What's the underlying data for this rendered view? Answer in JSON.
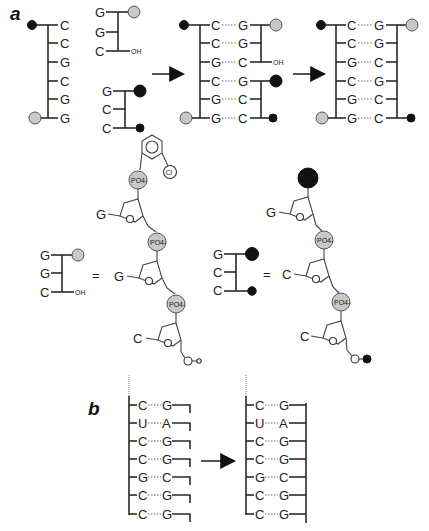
{
  "figure": {
    "panel_a_label": "a",
    "panel_b_label": "b",
    "panel_a": {
      "template_strand": {
        "bases": [
          "C",
          "C",
          "G",
          "C",
          "G",
          "G"
        ],
        "five_prime_mark": "black-dot",
        "three_prime_mark": "grey-circle"
      },
      "probe_1": {
        "bases": [
          "G",
          "G",
          "C"
        ],
        "top_mark": "grey-circle",
        "end_label": "OH"
      },
      "probe_2": {
        "bases": [
          "G",
          "C",
          "C"
        ],
        "top_mark": "black-circle-large",
        "bottom_mark": "black-dot"
      },
      "hybrid": {
        "left": [
          "C",
          "C",
          "G",
          "C",
          "G",
          "G"
        ],
        "right": [
          "G",
          "G",
          "C",
          "G",
          "C",
          "C"
        ],
        "oh_label": "OH"
      },
      "ligated": {
        "left": [
          "C",
          "C",
          "G",
          "C",
          "G",
          "G"
        ],
        "right": [
          "G",
          "G",
          "C",
          "G",
          "C",
          "C"
        ]
      },
      "legend_1": {
        "bases": [
          "G",
          "G",
          "C"
        ],
        "end_label": "OH",
        "equals": "=",
        "nucleotides": [
          "G",
          "C"
        ],
        "phosphate_label": "PO4-",
        "chloro_label": "Cl"
      },
      "legend_2": {
        "bases": [
          "G",
          "C",
          "C"
        ],
        "equals": "=",
        "nucleotides": [
          "G",
          "C",
          "C"
        ],
        "phosphate_label": "PO4-"
      }
    },
    "panel_b": {
      "before": {
        "left": [
          "C",
          "U",
          "C",
          "C",
          "G",
          "C",
          "C"
        ],
        "right": [
          "G",
          "A",
          "G",
          "G",
          "C",
          "G",
          "G"
        ]
      },
      "after": {
        "left": [
          "C",
          "U",
          "C",
          "C",
          "G",
          "C",
          "C"
        ],
        "right": [
          "G",
          "A",
          "G",
          "G",
          "C",
          "G",
          "G"
        ]
      }
    },
    "colors": {
      "grey_circle": "#c8c8c8",
      "black_circle": "#111111",
      "line": "#2a2a2a"
    }
  }
}
